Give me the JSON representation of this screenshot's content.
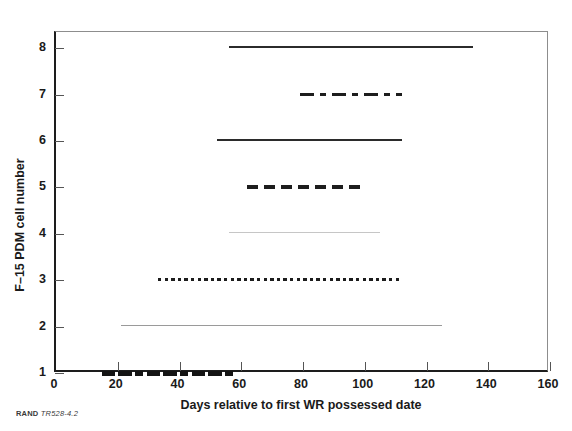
{
  "figure": {
    "source_credit_org": "RAND",
    "source_credit_id": "TR528-4.2"
  },
  "chart_data": {
    "type": "bar",
    "orientation": "horizontal-span",
    "title": "",
    "xlabel": "Days relative to first WR possessed date",
    "ylabel": "F–15 PDM cell number",
    "xlim": [
      0,
      160
    ],
    "ylim": [
      1,
      8.35
    ],
    "xticks": [
      0,
      20,
      40,
      60,
      80,
      100,
      120,
      140,
      160
    ],
    "yticks": [
      1,
      2,
      3,
      4,
      5,
      6,
      7,
      8
    ],
    "grid": false,
    "legend": "none",
    "series": [
      {
        "name": "cell-8",
        "cell": 8,
        "start": 56,
        "end": 135,
        "duration": 79,
        "style": "solid",
        "color": "#2b2b2b",
        "weight": "medium"
      },
      {
        "name": "cell-7",
        "cell": 7,
        "start": 79,
        "end": 112,
        "duration": 33,
        "style": "dash-dot",
        "color": "#1d1d1d",
        "weight": "heavy"
      },
      {
        "name": "cell-6",
        "cell": 6,
        "start": 52,
        "end": 112,
        "duration": 60,
        "style": "solid",
        "color": "#2b2b2b",
        "weight": "heavy"
      },
      {
        "name": "cell-5",
        "cell": 5,
        "start": 62,
        "end": 100,
        "duration": 38,
        "style": "dashed",
        "color": "#1d1d1d",
        "weight": "heavy"
      },
      {
        "name": "cell-4",
        "cell": 4,
        "start": 56,
        "end": 105,
        "duration": 49,
        "style": "solid",
        "color": "#c6c6c6",
        "weight": "light"
      },
      {
        "name": "cell-3",
        "cell": 3,
        "start": 33,
        "end": 112,
        "duration": 79,
        "style": "dotted",
        "color": "#1d1d1d",
        "weight": "medium"
      },
      {
        "name": "cell-2",
        "cell": 2,
        "start": 21,
        "end": 125,
        "duration": 104,
        "style": "solid",
        "color": "#9a9a9a",
        "weight": "light"
      },
      {
        "name": "cell-1",
        "cell": 1,
        "start": 15,
        "end": 58,
        "duration": 43,
        "style": "segmented",
        "color": "#141414",
        "weight": "very-heavy"
      }
    ]
  }
}
